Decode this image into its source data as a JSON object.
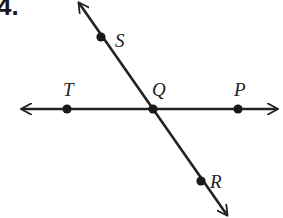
{
  "problem": {
    "number": "4."
  },
  "diagram": {
    "type": "intersecting-lines",
    "lines": [
      {
        "name": "line-TP",
        "points": [
          "T",
          "Q",
          "P"
        ],
        "arrows": "both"
      },
      {
        "name": "line-SR",
        "points": [
          "S",
          "Q",
          "R"
        ],
        "arrows": "both"
      }
    ],
    "points": {
      "S": {
        "label": "S",
        "x": 101,
        "y": 37,
        "lx": 115,
        "ly": 31
      },
      "T": {
        "label": "T",
        "x": 67,
        "y": 109,
        "lx": 63,
        "ly": 80
      },
      "Q": {
        "label": "Q",
        "x": 153,
        "y": 109,
        "lx": 152,
        "ly": 80
      },
      "P": {
        "label": "P",
        "x": 238,
        "y": 109,
        "lx": 234,
        "ly": 80
      },
      "R": {
        "label": "R",
        "x": 201,
        "y": 181,
        "lx": 210,
        "ly": 172
      }
    },
    "intersection": "Q",
    "colors": {
      "ink": "#222222",
      "background": "#ffffff"
    }
  }
}
